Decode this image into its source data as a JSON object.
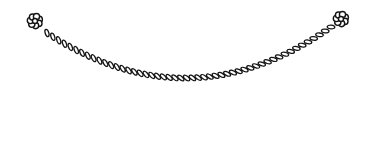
{
  "scene": {
    "background_color": "#ffffff",
    "line_color": "#141414",
    "description": "Black-and-white line drawing of a window swag valance: a twisted rope cord drapes in a curve between two knotted rosettes at the top corners, fabric cascades with zigzag folds hang down at each side, and the swag fabric's bottom edge arches across the middle."
  },
  "illustration": {
    "rope": {
      "start": [
        47,
        33
      ],
      "control": [
        190,
        126
      ],
      "end": [
        331,
        27
      ],
      "links": 50,
      "link_rx": 3.8,
      "link_ry": 1.8,
      "twist_deg": 40,
      "stroke_width": 1.3
    },
    "knots": {
      "left_center": [
        35,
        21
      ],
      "right_center": [
        341,
        19
      ],
      "petals": 7,
      "petal_r": 3.1,
      "ring_r": 4.6,
      "core_r": 2.5,
      "mask_r": 7.5,
      "stroke_width": 1.4
    },
    "parts": [
      "swag-bottom-edge",
      "swag-top-edge",
      "left-cascade",
      "right-cascade",
      "rope-cord",
      "left-rosette-knot",
      "right-rosette-knot"
    ]
  }
}
